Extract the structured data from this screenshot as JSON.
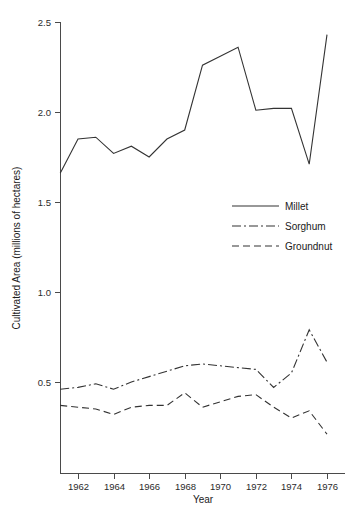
{
  "chart_data": {
    "type": "line",
    "title": "",
    "xlabel": "Year",
    "ylabel": "Cultivated Area (millions of hectares)",
    "xlim": [
      1960.6,
      1977.0
    ],
    "ylim": [
      0.08,
      2.52
    ],
    "grid": false,
    "legend_position": "center-right",
    "x_ticks": [
      1962,
      1964,
      1966,
      1968,
      1970,
      1972,
      1974,
      1976
    ],
    "x_tick_labels": [
      "1962",
      "1964",
      "1966",
      "1968",
      "1970",
      "1972",
      "1974",
      "1976"
    ],
    "y_ticks": [
      0.5,
      1.0,
      1.5,
      2.0,
      2.5
    ],
    "y_tick_labels": [
      "0.5",
      "1.0",
      "1.5",
      "2.0",
      "2.5"
    ],
    "x": [
      1961,
      1962,
      1963,
      1964,
      1965,
      1966,
      1967,
      1968,
      1969,
      1970,
      1971,
      1972,
      1973,
      1974,
      1975,
      1976
    ],
    "series": [
      {
        "name": "Millet",
        "style": "solid",
        "dash": "none",
        "color": "#333333",
        "values": [
          1.66,
          1.85,
          1.86,
          1.77,
          1.81,
          1.75,
          1.85,
          1.9,
          2.26,
          2.31,
          2.36,
          2.01,
          2.02,
          2.02,
          1.71,
          2.43
        ]
      },
      {
        "name": "Sorghum",
        "style": "dash-dot",
        "dash": "9,3,2,3",
        "color": "#333333",
        "values": [
          0.46,
          0.47,
          0.49,
          0.46,
          0.5,
          0.53,
          0.56,
          0.59,
          0.6,
          0.59,
          0.58,
          0.57,
          0.47,
          0.55,
          0.79,
          0.61
        ]
      },
      {
        "name": "Groundnut",
        "style": "dashed",
        "dash": "7,4",
        "color": "#333333",
        "values": [
          0.37,
          0.36,
          0.35,
          0.32,
          0.36,
          0.37,
          0.37,
          0.44,
          0.36,
          0.39,
          0.42,
          0.43,
          0.36,
          0.3,
          0.34,
          0.21
        ]
      }
    ]
  },
  "legend": {
    "items": [
      {
        "label": "Millet"
      },
      {
        "label": "Sorghum"
      },
      {
        "label": "Groundnut"
      }
    ]
  }
}
